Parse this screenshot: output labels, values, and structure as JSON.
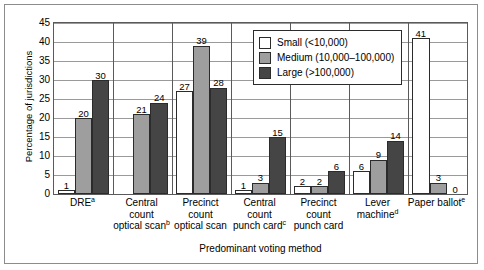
{
  "chart_data": {
    "type": "bar",
    "title": "",
    "xlabel": "Predominant voting method",
    "ylabel": "Percentage of jurisdictions",
    "ylim": [
      0,
      45
    ],
    "ytick_step": 5,
    "yticks": [
      "0",
      "5",
      "10",
      "15",
      "20",
      "25",
      "30",
      "35",
      "40",
      "45"
    ],
    "grid": true,
    "legend_position": "upper-right-inside",
    "categories": [
      {
        "lines": [
          "DRE"
        ],
        "note": "a"
      },
      {
        "lines": [
          "Central",
          "count",
          "optical scan"
        ],
        "note": "b"
      },
      {
        "lines": [
          "Precinct",
          "count",
          "optical scan"
        ],
        "note": ""
      },
      {
        "lines": [
          "Central",
          "count",
          "punch card"
        ],
        "note": "c"
      },
      {
        "lines": [
          "Precinct",
          "count",
          "punch card"
        ],
        "note": ""
      },
      {
        "lines": [
          "Lever",
          "machine"
        ],
        "note": "d"
      },
      {
        "lines": [
          "Paper ballot"
        ],
        "note": "e"
      }
    ],
    "series": [
      {
        "name": "Small (<10,000)",
        "color": "#ffffff",
        "values": [
          1,
          0,
          27,
          1,
          2,
          6,
          41
        ],
        "labels": [
          "1",
          "",
          "27",
          "1",
          "2",
          "6",
          "41"
        ]
      },
      {
        "name": "Medium (10,000–100,000)",
        "color": "#9e9e9e",
        "values": [
          20,
          21,
          39,
          3,
          2,
          9,
          3
        ],
        "labels": [
          "20",
          "21",
          "39",
          "3",
          "2",
          "9",
          "3"
        ]
      },
      {
        "name": "Large (>100,000)",
        "color": "#454545",
        "values": [
          30,
          24,
          28,
          15,
          6,
          14,
          0
        ],
        "labels": [
          "30",
          "24",
          "28",
          "15",
          "6",
          "14",
          "0"
        ]
      }
    ]
  },
  "legend": {
    "items": [
      {
        "label": "Small (<10,000)",
        "swatch": "sw-small"
      },
      {
        "label": "Medium (10,000–100,000)",
        "swatch": "sw-medium"
      },
      {
        "label": "Large (>100,000)",
        "swatch": "sw-large"
      }
    ]
  }
}
